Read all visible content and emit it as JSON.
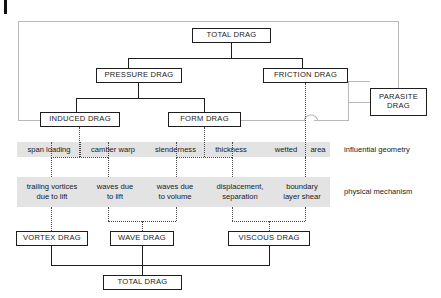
{
  "diagram": {
    "title_top": "TOTAL DRAG",
    "boxes": {
      "total_drag_top": "TOTAL DRAG",
      "pressure_drag": "PRESSURE DRAG",
      "friction_drag": "FRICTION DRAG",
      "parasite_drag_line1": "PARASITE",
      "parasite_drag_line2": "DRAG",
      "induced_drag": "INDUCED DRAG",
      "form_drag": "FORM DRAG",
      "vortex_drag": "VORTEX DRAG",
      "wave_drag": "WAVE DRAG",
      "viscous_drag": "VISCOUS DRAG",
      "total_drag_bottom": "TOTAL DRAG"
    },
    "geometry_row": {
      "label": "influential geometry",
      "cells": [
        "span loading",
        "camber warp",
        "slenderness",
        "thickness",
        "wetted",
        "area"
      ]
    },
    "mechanism_row": {
      "label": "physical mechanism",
      "cells": [
        "trailing vortices\ndue to lift",
        "waves due\nto lift",
        "waves due\nto volume",
        "displacement,\nseparation",
        "boundary\nlayer shear"
      ]
    },
    "colors": {
      "line_solid": "#1d1d1d",
      "line_gray": "#b9b9b9",
      "band": "#e3e3e3",
      "dotted": "#4a4a4a",
      "background": "#ffffff"
    }
  }
}
